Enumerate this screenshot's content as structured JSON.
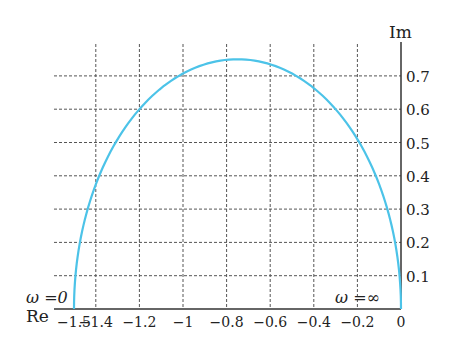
{
  "chart_data": {
    "type": "line",
    "title": "",
    "xlabel": "Re",
    "ylabel": "Im",
    "xlim": [
      -1.5,
      0
    ],
    "ylim": [
      0,
      0.75
    ],
    "grid": true,
    "x_ticks": [
      -1.5,
      -1.4,
      -1.2,
      -1,
      -0.8,
      -0.6,
      -0.4,
      -0.2,
      0
    ],
    "x_tick_labels": [
      "−1.5",
      "−1.4",
      "−1.2",
      "−1",
      "−0.8",
      "−0.6",
      "−0.4",
      "−0.2",
      "0"
    ],
    "y_ticks": [
      0.1,
      0.2,
      0.3,
      0.4,
      0.5,
      0.6,
      0.7
    ],
    "y_tick_labels": [
      "0.1",
      "0.2",
      "0.3",
      "0.4",
      "0.5",
      "0.6",
      "0.7"
    ],
    "series": [
      {
        "name": "Nyquist curve (semicircle)",
        "color": "#4cc3e8",
        "center": [
          -0.75,
          0
        ],
        "radius": 0.75,
        "x": [
          -1.5,
          -1.4,
          -1.2,
          -1.0,
          -0.75,
          -0.6,
          -0.4,
          -0.2,
          0
        ],
        "y": [
          0,
          0.44,
          0.6,
          0.71,
          0.75,
          0.73,
          0.65,
          0.49,
          0
        ]
      }
    ],
    "annotations": [
      {
        "text": "ω =0",
        "x": -1.5,
        "y": 0.03
      },
      {
        "text": "ω =∞",
        "x": 0,
        "y": 0.03
      }
    ]
  },
  "labels": {
    "xlabel": "Re",
    "ylabel": "Im",
    "omega_zero": "ω =0",
    "omega_inf": "ω =∞"
  },
  "colors": {
    "curve": "#4cc3e8",
    "axis": "#333333",
    "grid": "#555555"
  }
}
